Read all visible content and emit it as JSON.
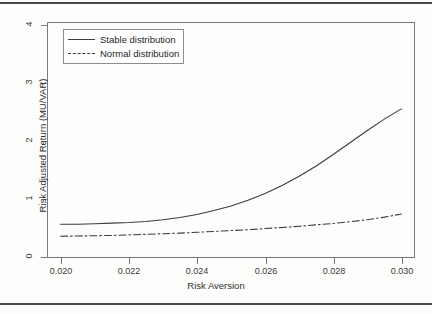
{
  "figure": {
    "background": "#fdfdfc",
    "frame_color": "#7b7b7b",
    "line_color": "#3b3b3b"
  },
  "legend": {
    "position": "top-left",
    "boxed": true,
    "entries": [
      {
        "label": "Stable distribution",
        "style": "solid",
        "key": "legend-key-solid"
      },
      {
        "label": "Normal distribution",
        "style": "dashdot",
        "key": "legend-key-dashdot"
      }
    ]
  },
  "axes": {
    "x_title": "Risk Aversion",
    "y_title": "Risk Adjusted Return (MU/VAR)",
    "x_ticks": [
      "0.020",
      "0.022",
      "0.024",
      "0.026",
      "0.028",
      "0.030"
    ],
    "y_ticks": [
      "0",
      "1",
      "2",
      "3",
      "4"
    ]
  },
  "chart_data": {
    "type": "line",
    "title": "",
    "xlabel": "Risk Aversion",
    "ylabel": "Risk Adjusted Return (MU/VAR)",
    "xlim": [
      0.0196,
      0.0304
    ],
    "ylim": [
      -0.06,
      4.07
    ],
    "xticks": [
      0.02,
      0.022,
      0.024,
      0.026,
      0.028,
      0.03
    ],
    "yticks": [
      0,
      1,
      2,
      3,
      4
    ],
    "xtick_labels": [
      "0.020",
      "0.022",
      "0.024",
      "0.026",
      "0.028",
      "0.030"
    ],
    "ytick_labels": [
      "0",
      "1",
      "2",
      "3",
      "4"
    ],
    "grid": false,
    "legend_position": "upper left",
    "x": [
      0.02,
      0.0205,
      0.021,
      0.0215,
      0.022,
      0.0225,
      0.023,
      0.0235,
      0.024,
      0.0245,
      0.025,
      0.0255,
      0.026,
      0.0265,
      0.027,
      0.0275,
      0.028,
      0.0285,
      0.029,
      0.0295,
      0.03
    ],
    "series": [
      {
        "name": "Stable distribution",
        "style": "solid",
        "color": "#3b3b3b",
        "values": [
          0.53,
          0.53,
          0.54,
          0.55,
          0.56,
          0.58,
          0.61,
          0.65,
          0.7,
          0.77,
          0.85,
          0.95,
          1.07,
          1.21,
          1.37,
          1.55,
          1.75,
          1.96,
          2.17,
          2.37,
          2.55
        ]
      },
      {
        "name": "Normal distribution",
        "style": "dashdot",
        "color": "#3b3b3b",
        "values": [
          0.32,
          0.325,
          0.33,
          0.335,
          0.345,
          0.355,
          0.365,
          0.375,
          0.39,
          0.405,
          0.42,
          0.435,
          0.455,
          0.475,
          0.495,
          0.52,
          0.545,
          0.575,
          0.61,
          0.655,
          0.71
        ]
      }
    ]
  }
}
